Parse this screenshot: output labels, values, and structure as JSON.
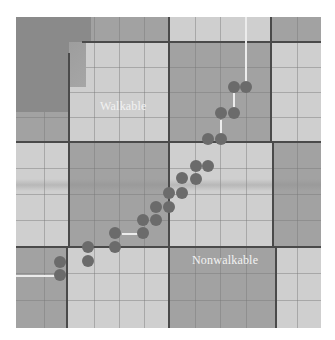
{
  "figure": {
    "labels": {
      "walkable": "Walkable",
      "nonwalkable": "Nonwalkable"
    },
    "colors": {
      "walkable_tile": "#cfcfcf",
      "nonwalkable_tile": "#a2a2a2",
      "major_grid_line": "#4a4a4a",
      "footstep": "#6b6b6b",
      "footstep_link": "#ececec"
    },
    "footsteps": [
      {
        "x": 60,
        "y": 262
      },
      {
        "x": 60,
        "y": 275
      },
      {
        "x": 88,
        "y": 247
      },
      {
        "x": 88,
        "y": 261
      },
      {
        "x": 115,
        "y": 233
      },
      {
        "x": 115,
        "y": 247
      },
      {
        "x": 143,
        "y": 233
      },
      {
        "x": 143,
        "y": 220
      },
      {
        "x": 156,
        "y": 220
      },
      {
        "x": 156,
        "y": 207
      },
      {
        "x": 169,
        "y": 207
      },
      {
        "x": 169,
        "y": 193
      },
      {
        "x": 182,
        "y": 193
      },
      {
        "x": 182,
        "y": 178
      },
      {
        "x": 196,
        "y": 179
      },
      {
        "x": 196,
        "y": 166
      },
      {
        "x": 208,
        "y": 166
      },
      {
        "x": 208,
        "y": 139
      },
      {
        "x": 221,
        "y": 139
      },
      {
        "x": 221,
        "y": 113
      },
      {
        "x": 234,
        "y": 113
      },
      {
        "x": 234,
        "y": 87
      },
      {
        "x": 246,
        "y": 87
      }
    ]
  }
}
